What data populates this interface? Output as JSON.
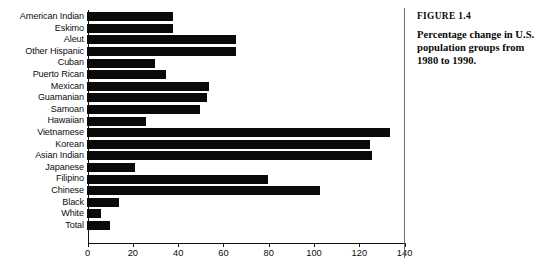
{
  "figure": {
    "number_label": "FIGURE 1.4",
    "caption": "Percentage change in U.S. population groups from 1980 to 1990."
  },
  "chart_data": {
    "type": "bar",
    "orientation": "horizontal",
    "title": "Percentage change in U.S. population groups from 1980 to 1990.",
    "xlabel": "",
    "ylabel": "",
    "xlim": [
      0,
      140
    ],
    "xticks": [
      0,
      20,
      40,
      60,
      80,
      100,
      120,
      140
    ],
    "grid": false,
    "legend": null,
    "bar_color": "#0a0a0a",
    "categories": [
      "American Indian",
      "Eskimo",
      "Aleut",
      "Other Hispanic",
      "Cuban",
      "Puerto Rican",
      "Mexican",
      "Guamanian",
      "Samoan",
      "Hawaiian",
      "Vietnamese",
      "Korean",
      "Asian Indian",
      "Japanese",
      "Filipino",
      "Chinese",
      "Black",
      "White",
      "Total"
    ],
    "values": [
      38,
      38,
      66,
      66,
      30,
      35,
      54,
      53,
      50,
      26,
      134,
      125,
      126,
      21,
      80,
      103,
      14,
      6,
      10
    ]
  }
}
